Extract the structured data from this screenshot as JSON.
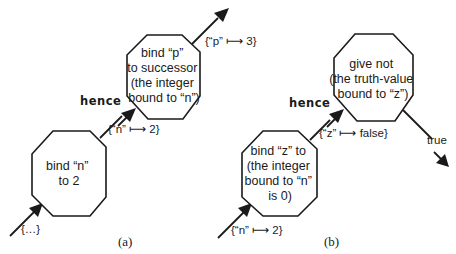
{
  "colors": {
    "stroke": "#1a1a1a",
    "background": "#ffffff"
  },
  "panel_a": {
    "caption": "(a)",
    "connector": "hence",
    "bottom_node": {
      "lines": [
        "bind “n”",
        "to 2"
      ]
    },
    "top_node": {
      "lines": [
        "bind “p”",
        "to successor",
        "(the integer",
        "bound to “n”)"
      ]
    },
    "input_label": "{…}",
    "middle_label": "{“n” ⟼ 2}",
    "output_label": "{“p” ⟼ 3}"
  },
  "panel_b": {
    "caption": "(b)",
    "connector": "hence",
    "bottom_node": {
      "lines": [
        "bind “z” to",
        "(the integer",
        "bound to “n”",
        "is 0)"
      ]
    },
    "top_node": {
      "lines": [
        "give not",
        "(the truth-value",
        "bound to “z”)"
      ]
    },
    "input_label": "{“n” ⟼ 2}",
    "middle_label": "{“z” ⟼ false}",
    "output_label": "true"
  }
}
